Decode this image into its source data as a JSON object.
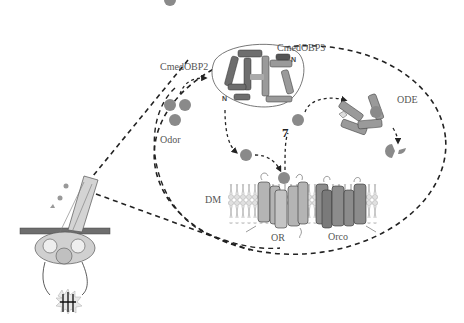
{
  "figure": {
    "type": "schematic diagram",
    "colors": {
      "background": "#ffffff",
      "dashed_line": "#222222",
      "odor_molecule": "#8a8a8a",
      "obp2_helix": "#6e6e6e",
      "obp3_helix": "#9a9a9a",
      "or_helix": "#b4b4b4",
      "orco_helix": "#8c8c8c",
      "membrane_head": "#d8d8d8",
      "label_text": "#555555"
    }
  },
  "labels": {
    "obp2": "CmedOBP2",
    "obp3": "CmedOBP3",
    "odor": "Odor",
    "ode": "ODE",
    "membrane": "DM",
    "or": "OR",
    "orco": "Orco",
    "n_terminus_1": "N",
    "n_terminus_2": "N",
    "c_terminus": "C"
  },
  "components": [
    {
      "id": "sensillum",
      "description": "Hair-like sensillum projecting from cuticle with neuron dendrites"
    },
    {
      "id": "zoom-ellipse",
      "description": "Dashed ellipse magnifying sensillum lymph interior"
    },
    {
      "id": "odor-molecules",
      "count": 3
    },
    {
      "id": "obp-dimer",
      "members": [
        "CmedOBP2",
        "CmedOBP3"
      ]
    },
    {
      "id": "ode",
      "description": "Odorant degrading enzyme with bound odor"
    },
    {
      "id": "degraded-odor",
      "description": "Fragmented odor molecule"
    },
    {
      "id": "receptor-complex",
      "members": [
        "OR",
        "Orco"
      ],
      "membrane": "DM"
    },
    {
      "id": "action-potential",
      "description": "Spike burst symbol below neuron"
    }
  ],
  "flow": [
    {
      "from": "odor",
      "to": "CmedOBP2"
    },
    {
      "from": "CmedOBP2",
      "to": "free odor"
    },
    {
      "from": "free odor",
      "to": "OR"
    },
    {
      "from": "OR",
      "to": "released odor"
    },
    {
      "from": "released odor",
      "to": "ODE"
    },
    {
      "from": "ODE",
      "to": "degraded odor"
    }
  ]
}
